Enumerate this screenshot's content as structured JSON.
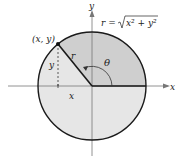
{
  "diagram": {
    "axis_x_label": "x",
    "axis_y_label": "y",
    "point_label": "(x, y)",
    "radius_label": "r",
    "angle_label": "θ",
    "horizontal_leg_label": "x",
    "vertical_leg_label": "y",
    "formula": {
      "lhs": "r = ",
      "radicand": "x² + y²"
    },
    "colors": {
      "sector_fill": "#cfcfcf",
      "circle_fill": "#e6e6e6",
      "stroke": "#1a1a1a",
      "axis": "#777777"
    }
  }
}
